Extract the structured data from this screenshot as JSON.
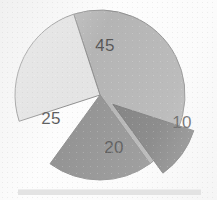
{
  "chart_data": {
    "type": "pie",
    "title": "",
    "subtitle": "",
    "xlabel": "",
    "ylabel": "",
    "legend_position": "none",
    "grid": false,
    "total": 100,
    "units": "percent",
    "start_angle_deg": -108,
    "direction": "clockwise",
    "center": {
      "x": 100,
      "y": 95
    },
    "radius": 85,
    "categories": [
      "45",
      "25",
      "20",
      "10"
    ],
    "values": [
      45,
      25,
      20,
      10
    ],
    "labels": [
      "45",
      "25",
      "20",
      "10"
    ],
    "colors": [
      "#9c9c9c",
      "#dcdcdc",
      "#6f6f6f",
      "#545454"
    ],
    "slices": [
      {
        "label": "45",
        "value": 45,
        "color": "#9c9c9c",
        "exploded": false,
        "explode_offset": 0,
        "start_angle_deg": -108,
        "sweep_deg": 162,
        "label_x": 105,
        "label_y": 47
      },
      {
        "label": "25",
        "value": 25,
        "color": "#dcdcdc",
        "exploded": false,
        "explode_offset": 0,
        "start_angle_deg": 162,
        "sweep_deg": 90,
        "label_x": 51,
        "label_y": 120
      },
      {
        "label": "20",
        "value": 20,
        "color": "#6f6f6f",
        "exploded": false,
        "explode_offset": 0,
        "start_angle_deg": 54,
        "sweep_deg": 72,
        "label_x": 114,
        "label_y": 149
      },
      {
        "label": "10",
        "value": 10,
        "color": "#545454",
        "exploded": true,
        "explode_offset": 16,
        "start_angle_deg": 18,
        "sweep_deg": 36,
        "label_x": 182,
        "label_y": 124
      }
    ],
    "outline_color": "#6a6a6a",
    "background_color": "#fdfdfd"
  },
  "footer": {
    "bar_color": "#e3e3e3"
  }
}
